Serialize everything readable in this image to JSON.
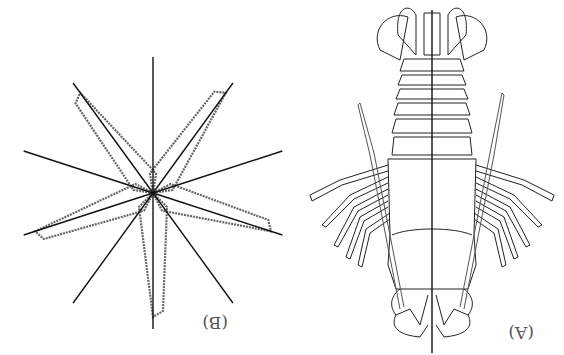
{
  "figure": {
    "orientation": "rotated-180",
    "panels": [
      {
        "id": "A",
        "label": "(A)",
        "subject": "lobster",
        "symmetry": "bilateral",
        "axis_count": 1
      },
      {
        "id": "B",
        "label": "(B)",
        "subject": "starfish",
        "symmetry": "radial",
        "axis_count": 10,
        "arms": 5
      }
    ]
  },
  "colors": {
    "line": "#222222",
    "stipple": "#666666",
    "label": "#555555",
    "background": "#ffffff"
  }
}
